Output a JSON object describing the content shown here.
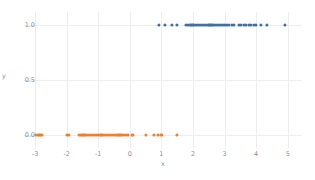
{
  "chart_data": {
    "type": "scatter",
    "title": "",
    "xlabel": "x",
    "ylabel": "y",
    "xlim": [
      -3.35,
      5.45
    ],
    "ylim": [
      -0.12,
      1.12
    ],
    "grid": true,
    "legend": "none",
    "xticks": [
      "-3",
      "-2",
      "-1",
      "0",
      "1",
      "2",
      "3",
      "4",
      "5"
    ],
    "xtick_values": [
      -3,
      -2,
      -1,
      0,
      1,
      2,
      3,
      4,
      5
    ],
    "yticks": [
      "0.0",
      "0.5",
      "1.0"
    ],
    "ytick_values": [
      0.0,
      0.5,
      1.0
    ],
    "colors": {
      "class_1": "#3f6fa8",
      "class_0": "#ef7f2f",
      "grid": "#eceef1",
      "background": "#ffffff",
      "tick_text": "#8a8f98"
    },
    "series": [
      {
        "name": "class 1",
        "color": "#3f6fa8",
        "y": 1.0,
        "x": [
          0.92,
          1.12,
          1.32,
          1.5,
          1.78,
          1.85,
          1.92,
          1.98,
          2.04,
          2.1,
          2.16,
          2.22,
          2.28,
          2.34,
          2.4,
          2.46,
          2.52,
          2.58,
          2.64,
          2.7,
          2.76,
          2.82,
          2.88,
          2.94,
          3.0,
          3.06,
          3.14,
          3.22,
          3.3,
          3.44,
          3.52,
          3.6,
          3.68,
          3.76,
          3.84,
          3.92,
          4.0,
          4.16,
          4.34,
          4.9
        ]
      },
      {
        "name": "class 0",
        "color": "#ef7f2f",
        "y": 0.0,
        "x": [
          -2.98,
          -2.92,
          -2.86,
          -2.8,
          -1.98,
          -1.92,
          -1.62,
          -1.56,
          -1.5,
          -1.44,
          -1.38,
          -1.32,
          -1.26,
          -1.2,
          -1.14,
          -1.08,
          -1.02,
          -0.96,
          -0.9,
          -0.84,
          -0.78,
          -0.72,
          -0.66,
          -0.6,
          -0.54,
          -0.48,
          -0.42,
          -0.36,
          -0.3,
          -0.24,
          -0.18,
          -0.12,
          -0.06,
          0.06,
          0.1,
          0.5,
          0.76,
          0.88,
          1.0,
          1.48
        ]
      }
    ]
  }
}
